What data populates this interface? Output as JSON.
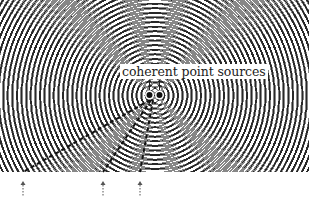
{
  "figure": {
    "label": "coherent point sources",
    "width": 311,
    "height": 200,
    "wave_region": {
      "x": 0,
      "y": 0,
      "width": 309,
      "height": 172
    },
    "sources": [
      {
        "name": "source-left",
        "x": 149.5,
        "y": 95
      },
      {
        "name": "source-right",
        "x": 159.5,
        "y": 95
      }
    ],
    "wavelength_px": 4.6,
    "colors": {
      "background": "#ffffff",
      "wave_dark": "#3a3a3a",
      "dashed_line": "#111111",
      "arrow": "#555555",
      "source_dot": "#111111"
    },
    "dashed_lines": [
      {
        "name": "nodal-line-far-left",
        "x1": 150,
        "y1": 100,
        "x2": 23,
        "y2": 172
      },
      {
        "name": "nodal-line-mid",
        "x1": 151,
        "y1": 100,
        "x2": 103,
        "y2": 172
      },
      {
        "name": "nodal-line-near",
        "x1": 153,
        "y1": 100,
        "x2": 140,
        "y2": 172
      }
    ],
    "arrows": [
      {
        "name": "arrow-far-left",
        "x": 23,
        "y": 181
      },
      {
        "name": "arrow-mid",
        "x": 103,
        "y": 181
      },
      {
        "name": "arrow-near",
        "x": 140,
        "y": 181
      }
    ]
  }
}
